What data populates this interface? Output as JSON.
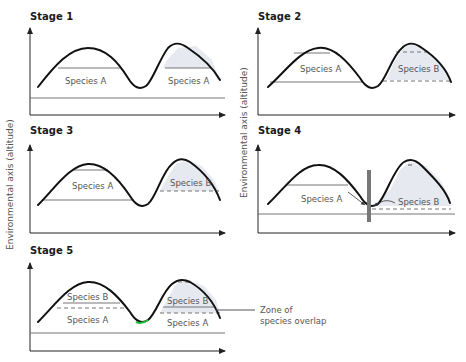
{
  "axis_label": "Environmental axis (altitude)",
  "stages": [
    {
      "title": "Stage 1",
      "labels": [
        "Species A",
        "Species A"
      ]
    },
    {
      "title": "Stage 2",
      "labels": [
        "Species A",
        "Species B"
      ]
    },
    {
      "title": "Stage 3",
      "labels": [
        "Species A",
        "Species B"
      ]
    },
    {
      "title": "Stage 4",
      "labels": [
        "Species A",
        "Species B"
      ]
    },
    {
      "title": "Stage 5",
      "labels": [
        "Species B",
        "Species A",
        "Species B",
        "Species A"
      ]
    }
  ],
  "annotation": {
    "line1": "Zone of",
    "line2": "species overlap"
  },
  "colors": {
    "curve": "#111111",
    "shade": "#e6e9f0",
    "range_line": "#777777",
    "barrier": "#777777"
  }
}
